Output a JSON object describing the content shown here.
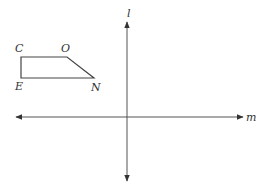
{
  "diagram": {
    "shape": {
      "name": "quadrilateral CONE",
      "vertices": [
        {
          "label": "C",
          "x": 21,
          "y": 57
        },
        {
          "label": "O",
          "x": 67,
          "y": 57
        },
        {
          "label": "N",
          "x": 94,
          "y": 78
        },
        {
          "label": "E",
          "x": 21,
          "y": 78
        }
      ]
    },
    "axes": {
      "horizontal": {
        "label": "m",
        "y": 117,
        "x1": 16,
        "x2": 243
      },
      "vertical": {
        "label": "l",
        "x": 127,
        "y1": 22,
        "y2": 181
      }
    },
    "colors": {
      "line": "#444444",
      "text": "#333333"
    }
  }
}
